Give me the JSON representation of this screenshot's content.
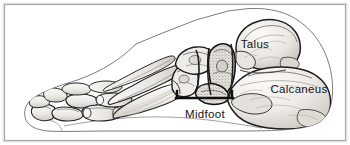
{
  "figure": {
    "kind": "anatomical-illustration",
    "background_color": "#ffffff",
    "frame": {
      "visible": true,
      "color": "#a8a8a8",
      "inset_px": 4
    }
  },
  "labels": {
    "talus": "Talus",
    "calcaneus": "Calcaneus",
    "midfoot": "Midfoot"
  },
  "annotations": {
    "midfoot_bracket": {
      "name": "midfoot-bracket",
      "orientation": "downward-opening",
      "color": "#101010",
      "x_start": 176,
      "x_end": 233,
      "bar_y": 98,
      "tick_height": 7
    }
  },
  "colors": {
    "outline": "#2b2b2b",
    "bone_fill": "#efede9",
    "bone_fill_dark": "#d9d6d1",
    "bone_shadow": "#8e8b86",
    "skin_outline": "#6d6d6d",
    "label_text": "#151515",
    "frame": "#a8a8a8"
  },
  "regions": [
    {
      "name": "phalanges",
      "label_shown": false
    },
    {
      "name": "metatarsals",
      "label_shown": false
    },
    {
      "name": "midfoot-tarsals",
      "label_shown": true
    },
    {
      "name": "talus",
      "label_shown": true
    },
    {
      "name": "calcaneus",
      "label_shown": true
    }
  ]
}
